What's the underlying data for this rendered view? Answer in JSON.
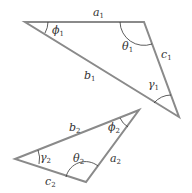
{
  "diagram": {
    "stroke_color": "#8a8a8a",
    "arc_color": "#333333",
    "triangle1": {
      "sides": {
        "a": "a",
        "a_sub": "1",
        "b": "b",
        "b_sub": "1",
        "c": "c",
        "c_sub": "1"
      },
      "angles": {
        "phi": "ϕ",
        "phi_sub": "1",
        "theta": "θ",
        "theta_sub": "1",
        "gamma": "γ",
        "gamma_sub": "1"
      }
    },
    "triangle2": {
      "sides": {
        "a": "a",
        "a_sub": "2",
        "b": "b",
        "b_sub": "2",
        "c": "c",
        "c_sub": "2"
      },
      "angles": {
        "phi": "ϕ",
        "phi_sub": "2",
        "theta": "θ",
        "theta_sub": "2",
        "gamma": "γ",
        "gamma_sub": "2"
      }
    }
  }
}
